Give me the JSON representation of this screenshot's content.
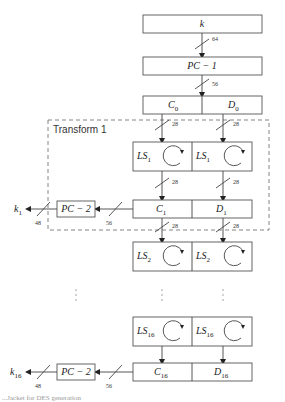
{
  "diagram": {
    "input_key": "k",
    "pc1_label": "PC − 1",
    "pc2_label": "PC − 2",
    "transform_label": "Transform 1",
    "bit_widths": {
      "k_to_pc1": "64",
      "pc1_to_cd": "56",
      "half": "28",
      "cd_to_pc2": "56",
      "pc2_out": "48"
    },
    "c0": "C",
    "c0_sub": "0",
    "d0": "D",
    "d0_sub": "0",
    "ls1_left": "LS",
    "ls1_left_sub": "1",
    "ls1_right": "LS",
    "ls1_right_sub": "1",
    "c1": "C",
    "c1_sub": "1",
    "d1": "D",
    "d1_sub": "1",
    "k1": "k",
    "k1_sub": "1",
    "ls2_left": "LS",
    "ls2_left_sub": "2",
    "ls2_right": "LS",
    "ls2_right_sub": "2",
    "ls16_left": "LS",
    "ls16_left_sub": "16",
    "ls16_right": "LS",
    "ls16_right_sub": "16",
    "c16": "C",
    "c16_sub": "16",
    "d16": "D",
    "d16_sub": "16",
    "k16": "k",
    "k16_sub": "16",
    "caption": "...Jacket for DES generation"
  },
  "colors": {
    "stroke": "#444444",
    "dashed_border": "#777777"
  }
}
